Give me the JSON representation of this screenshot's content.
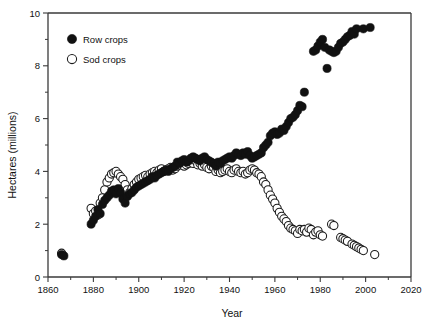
{
  "chart_data": {
    "type": "scatter",
    "title": "",
    "xlabel": "Year",
    "ylabel": "Hectares (millions)",
    "xlim": [
      1860,
      2020
    ],
    "ylim": [
      0,
      10
    ],
    "xticks": [
      1860,
      1880,
      1900,
      1920,
      1940,
      1960,
      1980,
      2000,
      2020
    ],
    "xticklabels": [
      "1860",
      "1880",
      "1900",
      "1920",
      "1940",
      "1960",
      "1980",
      "2000",
      "2020"
    ],
    "xticks_minor": [
      1870,
      1890,
      1910,
      1930,
      1950,
      1970,
      1990,
      2010
    ],
    "yticks": [
      0,
      2,
      4,
      6,
      8,
      10
    ],
    "yticklabels": [
      "0",
      "2",
      "4",
      "6",
      "8",
      "10"
    ],
    "yticks_minor": [
      1,
      3,
      5,
      7,
      9
    ],
    "grid": false,
    "legend_position": "upper-left",
    "legend": [
      {
        "name": "Row crops",
        "marker": "filled-circle",
        "color": "#111111"
      },
      {
        "name": "Sod crops",
        "marker": "open-circle",
        "color": "#ffffff"
      }
    ],
    "series": [
      {
        "name": "Row crops",
        "marker": "filled-circle",
        "points": [
          [
            1866,
            0.85
          ],
          [
            1867,
            0.8
          ],
          [
            1879,
            2.0
          ],
          [
            1880,
            2.15
          ],
          [
            1881,
            2.3
          ],
          [
            1882,
            2.55
          ],
          [
            1883,
            2.4
          ],
          [
            1884,
            2.75
          ],
          [
            1885,
            2.9
          ],
          [
            1886,
            3.0
          ],
          [
            1887,
            3.1
          ],
          [
            1888,
            3.25
          ],
          [
            1889,
            3.3
          ],
          [
            1890,
            3.15
          ],
          [
            1891,
            3.35
          ],
          [
            1892,
            3.2
          ],
          [
            1893,
            2.95
          ],
          [
            1894,
            2.8
          ],
          [
            1895,
            3.05
          ],
          [
            1896,
            3.15
          ],
          [
            1897,
            3.2
          ],
          [
            1898,
            3.3
          ],
          [
            1899,
            3.4
          ],
          [
            1900,
            3.45
          ],
          [
            1901,
            3.5
          ],
          [
            1902,
            3.55
          ],
          [
            1903,
            3.6
          ],
          [
            1904,
            3.65
          ],
          [
            1905,
            3.7
          ],
          [
            1906,
            3.8
          ],
          [
            1907,
            3.75
          ],
          [
            1908,
            3.85
          ],
          [
            1909,
            3.9
          ],
          [
            1910,
            3.95
          ],
          [
            1911,
            4.0
          ],
          [
            1912,
            4.05
          ],
          [
            1913,
            4.0
          ],
          [
            1914,
            4.1
          ],
          [
            1915,
            4.15
          ],
          [
            1916,
            4.2
          ],
          [
            1917,
            4.35
          ],
          [
            1918,
            4.3
          ],
          [
            1919,
            4.4
          ],
          [
            1920,
            4.45
          ],
          [
            1921,
            4.35
          ],
          [
            1922,
            4.4
          ],
          [
            1923,
            4.5
          ],
          [
            1924,
            4.55
          ],
          [
            1925,
            4.5
          ],
          [
            1926,
            4.45
          ],
          [
            1927,
            4.4
          ],
          [
            1928,
            4.5
          ],
          [
            1929,
            4.55
          ],
          [
            1930,
            4.45
          ],
          [
            1931,
            4.4
          ],
          [
            1932,
            4.35
          ],
          [
            1933,
            4.3
          ],
          [
            1934,
            4.2
          ],
          [
            1935,
            4.35
          ],
          [
            1936,
            4.3
          ],
          [
            1937,
            4.4
          ],
          [
            1938,
            4.45
          ],
          [
            1939,
            4.5
          ],
          [
            1940,
            4.55
          ],
          [
            1941,
            4.5
          ],
          [
            1942,
            4.6
          ],
          [
            1943,
            4.7
          ],
          [
            1944,
            4.65
          ],
          [
            1945,
            4.6
          ],
          [
            1946,
            4.7
          ],
          [
            1947,
            4.65
          ],
          [
            1948,
            4.75
          ],
          [
            1949,
            4.6
          ],
          [
            1950,
            4.5
          ],
          [
            1951,
            4.55
          ],
          [
            1952,
            4.6
          ],
          [
            1953,
            4.65
          ],
          [
            1954,
            4.7
          ],
          [
            1955,
            4.9
          ],
          [
            1956,
            5.0
          ],
          [
            1957,
            5.1
          ],
          [
            1958,
            5.35
          ],
          [
            1959,
            5.45
          ],
          [
            1960,
            5.5
          ],
          [
            1961,
            5.4
          ],
          [
            1962,
            5.45
          ],
          [
            1963,
            5.6
          ],
          [
            1964,
            5.55
          ],
          [
            1965,
            5.7
          ],
          [
            1966,
            5.85
          ],
          [
            1967,
            6.0
          ],
          [
            1968,
            6.05
          ],
          [
            1969,
            6.15
          ],
          [
            1970,
            6.3
          ],
          [
            1971,
            6.5
          ],
          [
            1972,
            6.45
          ],
          [
            1973,
            7.0
          ],
          [
            1977,
            8.55
          ],
          [
            1978,
            8.6
          ],
          [
            1979,
            8.75
          ],
          [
            1980,
            8.9
          ],
          [
            1981,
            9.0
          ],
          [
            1982,
            8.7
          ],
          [
            1983,
            7.9
          ],
          [
            1984,
            8.6
          ],
          [
            1985,
            8.55
          ],
          [
            1986,
            8.5
          ],
          [
            1987,
            8.55
          ],
          [
            1988,
            8.7
          ],
          [
            1989,
            8.85
          ],
          [
            1990,
            8.9
          ],
          [
            1991,
            9.0
          ],
          [
            1992,
            9.1
          ],
          [
            1993,
            9.15
          ],
          [
            1994,
            9.3
          ],
          [
            1995,
            9.2
          ],
          [
            1996,
            9.4
          ],
          [
            1999,
            9.4
          ],
          [
            2002,
            9.45
          ]
        ]
      },
      {
        "name": "Sod crops",
        "marker": "open-circle",
        "points": [
          [
            1866,
            0.9
          ],
          [
            1879,
            2.6
          ],
          [
            1880,
            2.4
          ],
          [
            1881,
            2.5
          ],
          [
            1882,
            2.35
          ],
          [
            1883,
            2.8
          ],
          [
            1884,
            3.0
          ],
          [
            1885,
            3.3
          ],
          [
            1886,
            3.6
          ],
          [
            1887,
            3.75
          ],
          [
            1888,
            3.9
          ],
          [
            1889,
            3.95
          ],
          [
            1890,
            4.0
          ],
          [
            1891,
            3.9
          ],
          [
            1892,
            3.8
          ],
          [
            1893,
            3.7
          ],
          [
            1894,
            3.5
          ],
          [
            1895,
            3.3
          ],
          [
            1896,
            3.2
          ],
          [
            1897,
            3.35
          ],
          [
            1898,
            3.5
          ],
          [
            1899,
            3.6
          ],
          [
            1900,
            3.7
          ],
          [
            1901,
            3.75
          ],
          [
            1902,
            3.8
          ],
          [
            1903,
            3.85
          ],
          [
            1904,
            3.8
          ],
          [
            1905,
            3.9
          ],
          [
            1906,
            3.95
          ],
          [
            1907,
            4.0
          ],
          [
            1908,
            3.95
          ],
          [
            1909,
            4.05
          ],
          [
            1910,
            4.1
          ],
          [
            1911,
            4.0
          ],
          [
            1912,
            4.05
          ],
          [
            1913,
            4.1
          ],
          [
            1914,
            4.15
          ],
          [
            1915,
            4.05
          ],
          [
            1916,
            4.1
          ],
          [
            1917,
            4.2
          ],
          [
            1918,
            4.25
          ],
          [
            1919,
            4.3
          ],
          [
            1920,
            4.2
          ],
          [
            1921,
            4.25
          ],
          [
            1922,
            4.3
          ],
          [
            1923,
            4.35
          ],
          [
            1924,
            4.3
          ],
          [
            1925,
            4.4
          ],
          [
            1926,
            4.25
          ],
          [
            1927,
            4.3
          ],
          [
            1928,
            4.2
          ],
          [
            1929,
            4.25
          ],
          [
            1930,
            4.15
          ],
          [
            1931,
            4.1
          ],
          [
            1932,
            4.2
          ],
          [
            1933,
            4.15
          ],
          [
            1934,
            4.0
          ],
          [
            1935,
            4.05
          ],
          [
            1936,
            3.95
          ],
          [
            1937,
            4.0
          ],
          [
            1938,
            4.05
          ],
          [
            1939,
            4.1
          ],
          [
            1940,
            4.0
          ],
          [
            1941,
            3.95
          ],
          [
            1942,
            4.05
          ],
          [
            1943,
            4.1
          ],
          [
            1944,
            4.0
          ],
          [
            1945,
            3.95
          ],
          [
            1946,
            4.0
          ],
          [
            1947,
            3.9
          ],
          [
            1948,
            3.95
          ],
          [
            1949,
            4.05
          ],
          [
            1950,
            4.1
          ],
          [
            1951,
            4.05
          ],
          [
            1952,
            3.95
          ],
          [
            1953,
            3.9
          ],
          [
            1954,
            3.8
          ],
          [
            1955,
            3.6
          ],
          [
            1956,
            3.5
          ],
          [
            1957,
            3.3
          ],
          [
            1958,
            3.1
          ],
          [
            1959,
            2.95
          ],
          [
            1960,
            2.8
          ],
          [
            1961,
            2.6
          ],
          [
            1962,
            2.45
          ],
          [
            1963,
            2.3
          ],
          [
            1964,
            2.2
          ],
          [
            1965,
            2.1
          ],
          [
            1966,
            1.95
          ],
          [
            1967,
            1.85
          ],
          [
            1968,
            1.8
          ],
          [
            1969,
            1.75
          ],
          [
            1970,
            1.65
          ],
          [
            1971,
            1.8
          ],
          [
            1972,
            1.75
          ],
          [
            1973,
            1.8
          ],
          [
            1974,
            1.7
          ],
          [
            1975,
            1.85
          ],
          [
            1976,
            1.8
          ],
          [
            1977,
            1.6
          ],
          [
            1978,
            1.7
          ],
          [
            1979,
            1.75
          ],
          [
            1980,
            1.6
          ],
          [
            1981,
            1.55
          ],
          [
            1985,
            2.0
          ],
          [
            1986,
            1.95
          ],
          [
            1989,
            1.5
          ],
          [
            1990,
            1.45
          ],
          [
            1991,
            1.4
          ],
          [
            1992,
            1.35
          ],
          [
            1994,
            1.25
          ],
          [
            1995,
            1.2
          ],
          [
            1996,
            1.15
          ],
          [
            1997,
            1.1
          ],
          [
            1998,
            1.05
          ],
          [
            1999,
            1.0
          ],
          [
            2004,
            0.85
          ]
        ]
      }
    ]
  }
}
